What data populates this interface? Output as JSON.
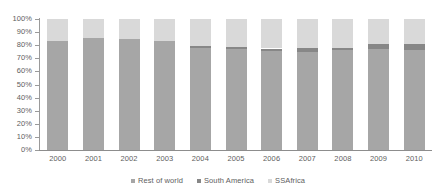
{
  "chart_data": {
    "type": "bar",
    "stacked": true,
    "normalized": true,
    "title": "",
    "subtitle": "",
    "xlabel": "",
    "ylabel": "",
    "ylim": [
      0,
      100
    ],
    "ytick_labels": [
      "100%",
      "90%",
      "80%",
      "70%",
      "60%",
      "50%",
      "40%",
      "30%",
      "20%",
      "10%",
      "0%"
    ],
    "ytick_values": [
      100,
      90,
      80,
      70,
      60,
      50,
      40,
      30,
      20,
      10,
      0
    ],
    "grid": false,
    "legend_position": "bottom",
    "categories": [
      "2000",
      "2001",
      "2002",
      "2003",
      "2004",
      "2005",
      "2006",
      "2007",
      "2008",
      "2009",
      "2010"
    ],
    "series": [
      {
        "name": "Rest of world",
        "color": "#a6a6a6",
        "values": [
          83,
          85.5,
          85,
          83.5,
          78,
          77,
          75.5,
          75,
          76,
          77,
          76.5
        ]
      },
      {
        "name": "South America",
        "color": "#878787",
        "values": [
          0,
          0,
          0,
          0,
          1.5,
          1.5,
          2,
          3,
          2,
          4,
          4.5
        ]
      },
      {
        "name": "SSAfrica",
        "color": "#d9d9d9",
        "values": [
          17,
          14.5,
          15,
          16.5,
          20.5,
          21.5,
          22.5,
          22,
          22,
          19,
          19
        ]
      }
    ]
  },
  "legend": {
    "items": [
      {
        "label": "Rest of world",
        "marker": "square-marker"
      },
      {
        "label": "South America",
        "marker": "square-marker"
      },
      {
        "label": "SSAfrica",
        "marker": "square-marker"
      }
    ]
  }
}
